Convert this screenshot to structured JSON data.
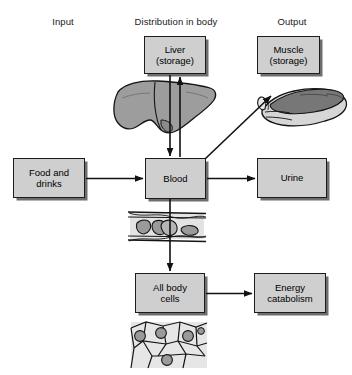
{
  "diagram": {
    "headers": [
      {
        "name": "input",
        "label": "Input",
        "x": 63,
        "y": 22
      },
      {
        "name": "distribution",
        "label": "Distribution in body",
        "x": 176,
        "y": 22
      },
      {
        "name": "output",
        "label": "Output",
        "x": 292,
        "y": 22
      }
    ],
    "boxes": [
      {
        "name": "liver-storage",
        "label": "Liver\n(storage)",
        "x": 144,
        "y": 36,
        "w": 62,
        "h": 38
      },
      {
        "name": "muscle-storage",
        "label": "Muscle\n(storage)",
        "x": 257,
        "y": 36,
        "w": 63,
        "h": 38
      },
      {
        "name": "food-and-drinks",
        "label": "Food and\ndrinks",
        "x": 13,
        "y": 158,
        "w": 72,
        "h": 40
      },
      {
        "name": "blood",
        "label": "Blood",
        "x": 145,
        "y": 158,
        "w": 61,
        "h": 41
      },
      {
        "name": "urine",
        "label": "Urine",
        "x": 257,
        "y": 158,
        "w": 70,
        "h": 40
      },
      {
        "name": "all-body-cells",
        "label": "All body\ncells",
        "x": 135,
        "y": 273,
        "w": 70,
        "h": 40
      },
      {
        "name": "energy-catabolism",
        "label": "Energy\ncatabolism",
        "x": 254,
        "y": 273,
        "w": 72,
        "h": 40
      }
    ],
    "arrows": [
      {
        "name": "arrow-food-to-blood",
        "from": "food-and-drinks",
        "to": "blood",
        "direction": "right"
      },
      {
        "name": "arrow-blood-to-urine",
        "from": "blood",
        "to": "urine",
        "direction": "right"
      },
      {
        "name": "arrow-liver-to-blood",
        "from": "liver-storage",
        "to": "blood",
        "direction": "down"
      },
      {
        "name": "arrow-blood-to-liver",
        "from": "blood",
        "to": "liver-storage",
        "direction": "up"
      },
      {
        "name": "arrow-blood-to-muscle",
        "from": "blood",
        "to": "muscle-storage",
        "direction": "diagonal-up-right"
      },
      {
        "name": "arrow-blood-to-body-cells",
        "from": "blood",
        "to": "all-body-cells",
        "direction": "down"
      },
      {
        "name": "arrow-cells-to-catabolism",
        "from": "all-body-cells",
        "to": "energy-catabolism",
        "direction": "right"
      }
    ],
    "illustrations": [
      {
        "name": "liver-illustration",
        "caption": "liver organ",
        "x": 112,
        "y": 82,
        "w": 104,
        "h": 58
      },
      {
        "name": "muscle-illustration",
        "caption": "skeletal muscle",
        "x": 248,
        "y": 86,
        "w": 100,
        "h": 50
      },
      {
        "name": "blood-vessel-illustration",
        "caption": "blood vessel with red cells",
        "x": 128,
        "y": 205,
        "w": 78,
        "h": 42
      },
      {
        "name": "body-cells-illustration",
        "caption": "tissue cells with nuclei",
        "x": 130,
        "y": 320,
        "w": 78,
        "h": 50
      }
    ],
    "colors": {
      "box_fill": "#cfcfcf",
      "box_border": "#1c1c1c",
      "box_shadow": "#6e6e6e",
      "organ_fill": "#9d9d9d",
      "cell_fill": "#dcdcdc",
      "nucleus_fill": "#9a9a9a",
      "line": "#111111",
      "background": "#ffffff"
    }
  }
}
